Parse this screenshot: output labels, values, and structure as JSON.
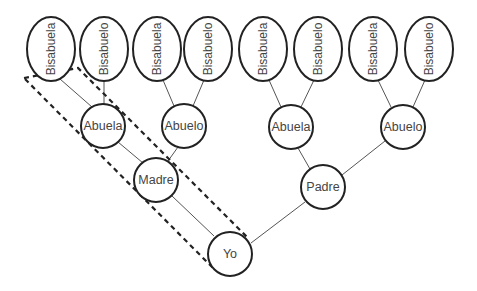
{
  "diagram": {
    "type": "family-tree",
    "colors": {
      "stroke": "#222222",
      "edge": "#555555",
      "text": "#444444",
      "background": "#ffffff"
    },
    "great_grandparents": [
      {
        "label": "Bisabuela",
        "cx": 51,
        "cy": 49
      },
      {
        "label": "Bisabuelo",
        "cx": 104,
        "cy": 49
      },
      {
        "label": "Bisabuela",
        "cx": 157,
        "cy": 49
      },
      {
        "label": "Bisabuelo",
        "cx": 208,
        "cy": 49
      },
      {
        "label": "Bisabuela",
        "cx": 263,
        "cy": 49
      },
      {
        "label": "Bisabuelo",
        "cx": 318,
        "cy": 49
      },
      {
        "label": "Bisabuela",
        "cx": 373,
        "cy": 49
      },
      {
        "label": "Bisabuelo",
        "cx": 429,
        "cy": 49
      }
    ],
    "grandparents": [
      {
        "label": "Abuela",
        "cx": 103,
        "cy": 126
      },
      {
        "label": "Abuelo",
        "cx": 184,
        "cy": 126
      },
      {
        "label": "Abuela",
        "cx": 291,
        "cy": 127
      },
      {
        "label": "Abuelo",
        "cx": 403,
        "cy": 127
      }
    ],
    "parents": [
      {
        "label": "Madre",
        "cx": 156,
        "cy": 180
      },
      {
        "label": "Padre",
        "cx": 323,
        "cy": 187
      }
    ],
    "self": {
      "label": "Yo",
      "cx": 230,
      "cy": 254
    },
    "highlight": {
      "style": "dashed",
      "description": "maternal line: Bisabuelo - Abuela - Madre - Yo"
    }
  }
}
